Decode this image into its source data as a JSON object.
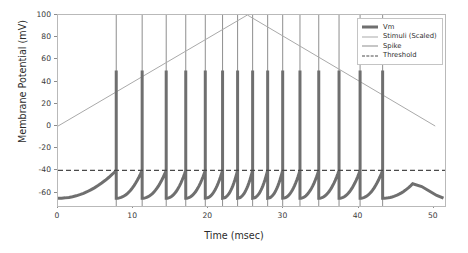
{
  "chart_data": {
    "type": "line",
    "title": "",
    "xlabel": "Time (msec)",
    "ylabel": "Membrane Potential (mV)",
    "xlim": [
      0,
      51.5
    ],
    "ylim": [
      -72,
      100
    ],
    "grid": false,
    "xticks": [
      0,
      10,
      20,
      30,
      40,
      50
    ],
    "xtick_labels": [
      "0",
      "10",
      "20",
      "30",
      "40",
      "50"
    ],
    "yticks": [
      -60,
      -40,
      -20,
      0,
      20,
      40,
      60,
      80,
      100
    ],
    "ytick_labels": [
      "-60",
      "-40",
      "-20",
      "0",
      "20",
      "40",
      "60",
      "80",
      "100"
    ],
    "legend_position": "upper right",
    "series": [
      {
        "name": "Vm",
        "type": "line",
        "color": "#6f6f6f",
        "linewidth": 3,
        "description": "Membrane potential with leaky integrate-and-fire spikes peaking at 50 mV",
        "resting_potential": -65,
        "spike_peak": 50,
        "reset_potential": -65,
        "x": [
          0,
          1,
          2,
          3,
          4,
          5,
          6,
          7,
          7.7
        ],
        "y": [
          -65,
          -64.7,
          -64.1,
          -63.2,
          -61.8,
          -59.9,
          -57.2,
          -53.4,
          -40
        ]
      },
      {
        "name": "Stimuli (Scaled)",
        "type": "line",
        "color": "#a9a9a9",
        "linewidth": 1,
        "description": "Triangular ramp stimulus, scaled to the membrane potential axis",
        "x": [
          0,
          25.2,
          50.2
        ],
        "y": [
          0,
          100,
          0
        ]
      },
      {
        "name": "Spike",
        "type": "vline",
        "color": "#8e8e8e",
        "linewidth": 1,
        "description": "Vertical spike raster markers drawn from axis bottom to 100 mV",
        "spike_times": [
          7.75,
          11.2,
          14.4,
          17.0,
          19.6,
          21.9,
          23.9,
          25.9,
          27.9,
          29.9,
          32.2,
          34.7,
          37.4,
          40.2,
          43.2
        ]
      },
      {
        "name": "Threshold",
        "type": "hline",
        "color": "#4a4a4a",
        "linewidth": 1.3,
        "linestyle": "dashed",
        "value": -40
      }
    ],
    "spike_count": 15,
    "spike_amplitude_mv": 50,
    "threshold_mv": -40,
    "resting_mv": -65
  },
  "legend": {
    "entries": [
      {
        "label": "Vm",
        "style": "thick-solid"
      },
      {
        "label": "Stimuli (Scaled)",
        "style": "thin-solid"
      },
      {
        "label": "Spike",
        "style": "thin-solid"
      },
      {
        "label": "Threshold",
        "style": "dashed"
      }
    ]
  },
  "colors": {
    "vm": "#6f6f6f",
    "stimuli": "#a9a9a9",
    "spike": "#8e8e8e",
    "threshold": "#4a4a4a",
    "axis": "#b9b9b9",
    "background": "#ffffff"
  }
}
